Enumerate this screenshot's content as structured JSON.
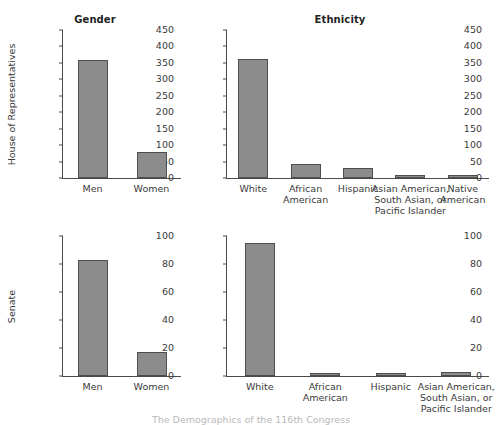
{
  "chart_data": [
    {
      "type": "bar",
      "id": "house-gender",
      "title": "Gender",
      "xlabel": "",
      "ylabel": "House of Representatives",
      "categories": [
        "Men",
        "Women"
      ],
      "values": [
        360,
        78
      ],
      "ylim": [
        0,
        450
      ],
      "yticks": [
        0,
        50,
        100,
        150,
        200,
        250,
        300,
        350,
        400,
        450
      ],
      "ytick_labels": [
        "0",
        "50",
        "100",
        "150",
        "200",
        "250",
        "300",
        "350",
        "400",
        "450"
      ],
      "grid": false,
      "legend": "none",
      "bar_color": "#8c8c8c",
      "bar_edge_color": "#4d4d4d"
    },
    {
      "type": "bar",
      "id": "house-ethnicity",
      "title": "Ethnicity",
      "xlabel": "",
      "ylabel": "",
      "categories": [
        "White",
        "African\nAmerican",
        "Hispanic",
        "Asian American,\nSouth Asian, or\nPacific Islander",
        "Native\nAmerican"
      ],
      "values": [
        363,
        43,
        31,
        4,
        4
      ],
      "ylim": [
        0,
        450
      ],
      "yticks": [
        0,
        50,
        100,
        150,
        200,
        250,
        300,
        350,
        400,
        450
      ],
      "ytick_labels": [
        "0",
        "50",
        "100",
        "150",
        "200",
        "250",
        "300",
        "350",
        "400",
        "450"
      ],
      "grid": false,
      "legend": "none",
      "bar_color": "#8c8c8c",
      "bar_edge_color": "#4d4d4d"
    },
    {
      "type": "bar",
      "id": "senate-gender",
      "title": "",
      "xlabel": "",
      "ylabel": "Senate",
      "categories": [
        "Men",
        "Women"
      ],
      "values": [
        83,
        17
      ],
      "ylim": [
        0,
        100
      ],
      "yticks": [
        0,
        20,
        40,
        60,
        80,
        100
      ],
      "ytick_labels": [
        "0",
        "20",
        "40",
        "60",
        "80",
        "100"
      ],
      "grid": false,
      "legend": "none",
      "bar_color": "#8c8c8c",
      "bar_edge_color": "#4d4d4d"
    },
    {
      "type": "bar",
      "id": "senate-ethnicity",
      "title": "",
      "xlabel": "",
      "ylabel": "",
      "categories": [
        "White",
        "African\nAmerican",
        "Hispanic",
        "Asian American,\nSouth Asian, or\nPacific Islander"
      ],
      "values": [
        95,
        1,
        2,
        3
      ],
      "ylim": [
        0,
        100
      ],
      "yticks": [
        0,
        20,
        40,
        60,
        80,
        100
      ],
      "ytick_labels": [
        "0",
        "20",
        "40",
        "60",
        "80",
        "100"
      ],
      "grid": false,
      "legend": "none",
      "bar_color": "#8c8c8c",
      "bar_edge_color": "#4d4d4d"
    }
  ],
  "caption": {
    "text": "The Demographics of the 116th Congress"
  }
}
